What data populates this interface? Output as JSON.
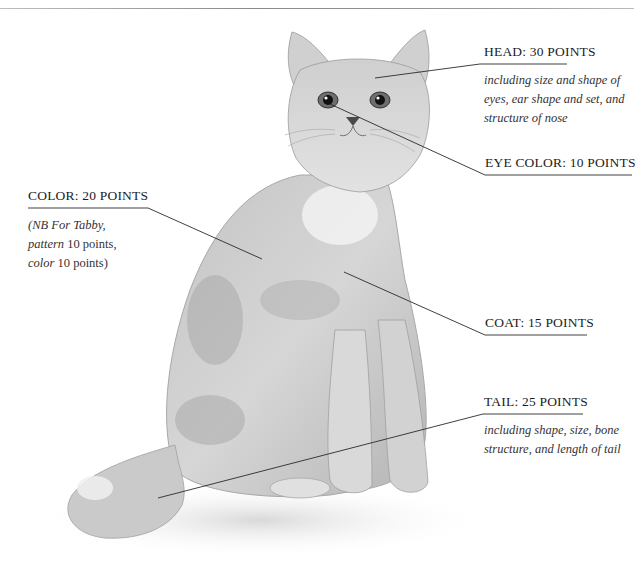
{
  "diagram": {
    "labels": {
      "head": {
        "title": "HEAD: 30 POINTS",
        "description_lines": [
          "including size and shape of",
          "eyes, ear shape and set, and",
          "structure of nose"
        ]
      },
      "eye_color": {
        "title": "EYE COLOR: 10 POINTS"
      },
      "color": {
        "title": "COLOR: 20 POINTS",
        "description_lines": [
          {
            "italic": "(NB For Tabby,",
            "plain": ""
          },
          {
            "italic": "pattern",
            "plain": " 10 points,"
          },
          {
            "italic": "color",
            "plain": " 10 points)"
          }
        ]
      },
      "coat": {
        "title": "COAT: 15 POINTS"
      },
      "tail": {
        "title": "TAIL: 25 POINTS",
        "description_lines": [
          "including shape, size, bone",
          "structure, and length of tail"
        ]
      }
    },
    "colors": {
      "line": "#2a2a2a",
      "text": "#1c1c1c",
      "cat_fur_light": "#e6e6e6",
      "cat_fur_mid": "#bdbdbd",
      "cat_fur_dark": "#8c8c8c"
    }
  }
}
